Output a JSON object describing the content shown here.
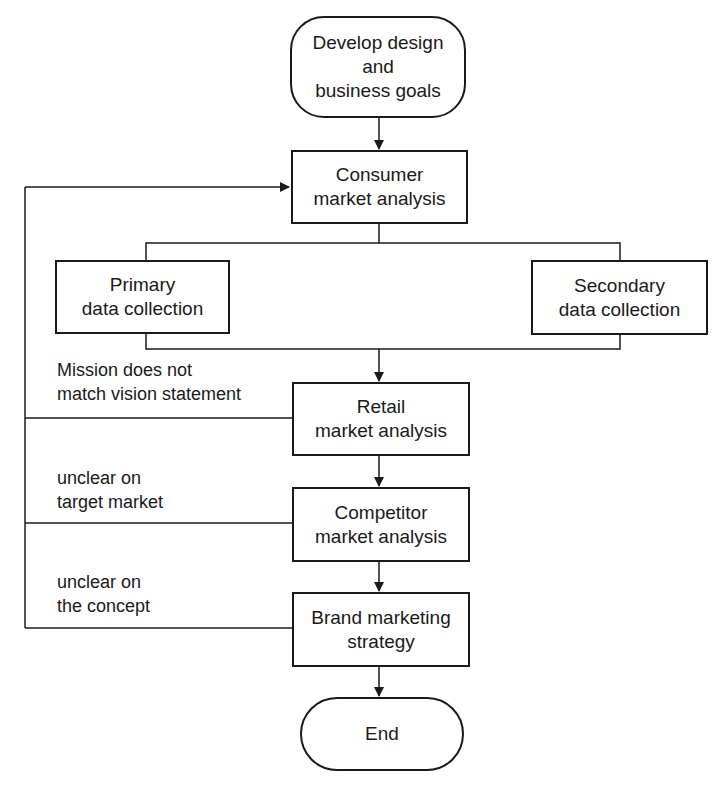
{
  "nodes": {
    "start": {
      "line1": "Develop design",
      "line2": "and",
      "line3": "business goals"
    },
    "consumer": {
      "line1": "Consumer",
      "line2": "market analysis"
    },
    "primary": {
      "line1": "Primary",
      "line2": "data collection"
    },
    "secondary": {
      "line1": "Secondary",
      "line2": "data collection"
    },
    "retail": {
      "line1": "Retail",
      "line2": "market analysis"
    },
    "competitor": {
      "line1": "Competitor",
      "line2": "market analysis"
    },
    "brand": {
      "line1": "Brand marketing",
      "line2": "strategy"
    },
    "end": {
      "line1": "End"
    }
  },
  "feedback_labels": {
    "retail": {
      "line1": "Mission does not",
      "line2": "match vision statement"
    },
    "competitor": {
      "line1": "unclear on",
      "line2": "target market"
    },
    "brand": {
      "line1": "unclear on",
      "line2": "the concept"
    }
  },
  "colors": {
    "stroke": "#1a1a1a",
    "background": "#ffffff"
  }
}
